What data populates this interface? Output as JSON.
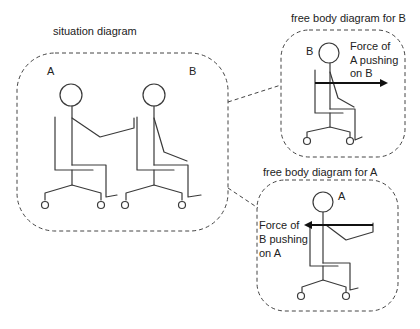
{
  "situation": {
    "title": "situation diagram",
    "label_a": "A",
    "label_b": "B"
  },
  "fbd_b": {
    "title": "free body diagram for B",
    "label": "B",
    "force_lines": [
      "Force of",
      "A pushing",
      "on B"
    ]
  },
  "fbd_a": {
    "title": "free body diagram for A",
    "label": "A",
    "force_lines": [
      "Force of",
      "B pushing",
      "on A"
    ]
  }
}
